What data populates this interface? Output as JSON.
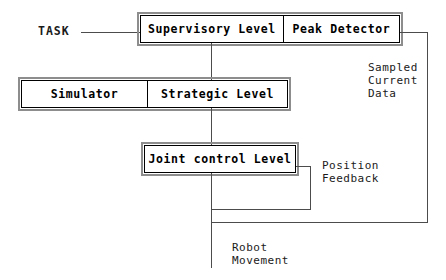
{
  "diagram": {
    "background_color": "#ffffff",
    "line_color": "#4c4c4c",
    "box_border_color": "#000000",
    "box_shadow_color": "#8d8d8d",
    "text_color": "#000000"
  },
  "boxes": [
    {
      "id": "supervisory-row",
      "cells": [
        {
          "id": "supervisory-level",
          "label": "Supervisory Level"
        },
        {
          "id": "peak-detector",
          "label": "Peak Detector"
        }
      ]
    },
    {
      "id": "strategic-row",
      "cells": [
        {
          "id": "simulator",
          "label": "Simulator"
        },
        {
          "id": "strategic-level",
          "label": "Strategic Level"
        }
      ]
    },
    {
      "id": "joint-row",
      "cells": [
        {
          "id": "joint-control-level",
          "label": "Joint control Level"
        }
      ]
    }
  ],
  "labels": {
    "task": "TASK",
    "sampled_current_data": "Sampled\nCurrent\nData",
    "position_feedback": "Position\nFeedback",
    "robot_movement": "Robot\nMovement"
  },
  "connections": [
    {
      "id": "task-to-supervisory",
      "from": "TASK",
      "to": "Supervisory Level"
    },
    {
      "id": "supervisory-to-strategic",
      "from": "Supervisory Level",
      "to": "Strategic Level"
    },
    {
      "id": "strategic-to-joint",
      "from": "Strategic Level",
      "to": "Joint control Level"
    },
    {
      "id": "joint-to-position-feedback",
      "from": "Joint control Level",
      "to": "Position Feedback"
    },
    {
      "id": "peak-detector-sampled-current-data",
      "from": "Peak Detector",
      "to": "Sampled Current Data"
    },
    {
      "id": "joint-to-robot-movement",
      "from": "Joint control Level",
      "to": "Robot Movement"
    }
  ]
}
